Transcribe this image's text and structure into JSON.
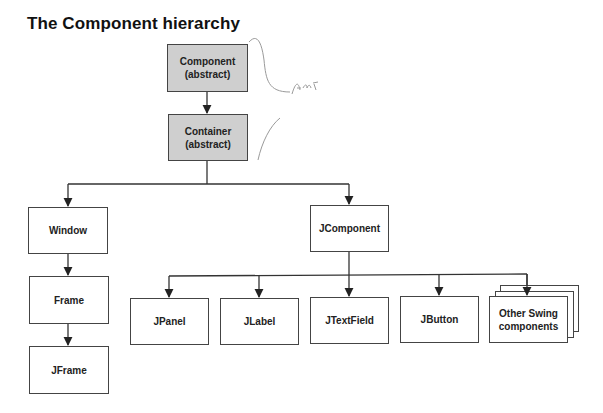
{
  "title": "The Component hierarchy",
  "colors": {
    "abstract_fill": "#cfcfcf",
    "box_border": "#444444",
    "line": "#333333",
    "annotation_ink": "#9a9a9a"
  },
  "nodes": {
    "component": {
      "line1": "Component",
      "line2": "(abstract)",
      "abstract": true
    },
    "container": {
      "line1": "Container",
      "line2": "(abstract)",
      "abstract": true
    },
    "window": {
      "label": "Window"
    },
    "frame": {
      "label": "Frame"
    },
    "jframe": {
      "label": "JFrame"
    },
    "jcomponent": {
      "label": "JComponent"
    },
    "jpanel": {
      "label": "JPanel"
    },
    "jlabel": {
      "label": "JLabel"
    },
    "jtextfield": {
      "label": "JTextField"
    },
    "jbutton": {
      "label": "JButton"
    },
    "other_swing": {
      "line1": "Other Swing",
      "line2": "components",
      "stacked": true
    }
  },
  "edges": [
    {
      "from": "component",
      "to": "container"
    },
    {
      "from": "container",
      "to": "window"
    },
    {
      "from": "container",
      "to": "jcomponent"
    },
    {
      "from": "window",
      "to": "frame"
    },
    {
      "from": "frame",
      "to": "jframe"
    },
    {
      "from": "jcomponent",
      "to": "jpanel"
    },
    {
      "from": "jcomponent",
      "to": "jlabel"
    },
    {
      "from": "jcomponent",
      "to": "jtextfield"
    },
    {
      "from": "jcomponent",
      "to": "jbutton"
    },
    {
      "from": "jcomponent",
      "to": "other_swing"
    }
  ],
  "annotation": {
    "handwritten_text": "Am I",
    "note": "handwritten bracket marks beside abstract classes"
  }
}
